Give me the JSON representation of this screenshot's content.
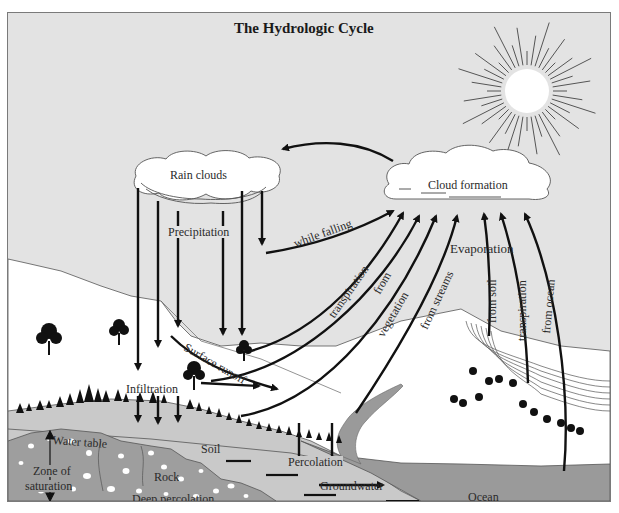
{
  "title": "The Hydrologic Cycle",
  "clouds": {
    "rain": "Rain clouds",
    "formation": "Cloud formation"
  },
  "labels": {
    "precipitation": "Precipitation",
    "while_falling": "while falling",
    "transpiration_left": "transpiration",
    "from": "from",
    "vegetation": "vegetation",
    "from_streams": "from streams",
    "evaporation": "Evaporation",
    "from_soil": "from soil",
    "transpiration_right": "transpiration",
    "from_ocean": "from ocean",
    "surface_runoff": "Surface runoff",
    "infiltration": "Infiltration",
    "water_table": "Water table",
    "soil": "Soil",
    "zone_of": "Zone of",
    "saturation": "saturation",
    "rock": "Rock",
    "deep_percolation": "Deep percolation",
    "percolation": "Percolation",
    "groundwater": "Groundwater",
    "ocean": "Ocean"
  },
  "colors": {
    "sky": "#e3e3e3",
    "land": "#ffffff",
    "soil": "#c9c9c9",
    "rock": "#9e9e9e",
    "ocean": "#9a9a9a",
    "arrow": "#111111",
    "sun_rays": "#555555"
  }
}
